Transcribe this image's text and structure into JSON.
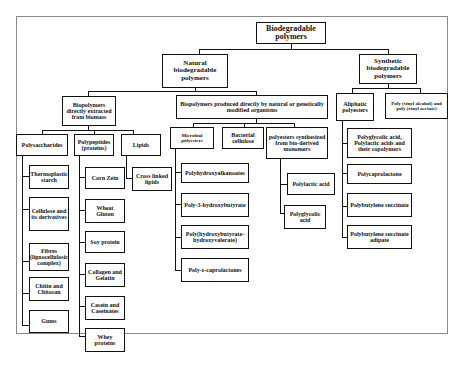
{
  "diagram": {
    "root": "Biodegradable polymers",
    "natural": {
      "label": "Natural biodegradable polymers",
      "extracted": {
        "label": "Biopolymers directly extracted from biomass",
        "polysaccharides": {
          "label": "Polysaccharides",
          "items": [
            "Thermoplastic starch",
            "Cellulose and its derivatives",
            "Fibres (lignocellulosic complex)",
            "Chitin and Chitosan",
            "Gums"
          ]
        },
        "polypeptides": {
          "label": "Polypeptides (proteins)",
          "items": [
            "Corn Zein",
            "Wheat Gluten",
            "Soy protein",
            "Collagen and Gelatin",
            "Casein and Caseinates",
            "Whey proteins"
          ]
        },
        "lipids": {
          "label": "Lipids",
          "items": [
            "Cross linked lipids"
          ]
        }
      },
      "organisms": {
        "label": "Biopolymers produced directly by natural or genetically modified organisms",
        "microbial": {
          "label": "Microbial polyesters",
          "items": [
            "Polyhydroxyalkanoates",
            "Poly-3-hydroxybutyrate",
            "Poly(hydroxybutyrate-hydroxyvalerate)",
            "Poly-ε-caprolactones"
          ]
        },
        "bacterial": {
          "label": "Bacterial cellulose"
        },
        "biomonomers": {
          "label": "polyesters synthesized from bio-derived monomers",
          "items": [
            "Polylactic acid",
            "Polyglycolic acid"
          ]
        }
      }
    },
    "synthetic": {
      "label": "Synthetic biodegradable polymers",
      "aliphatic": {
        "label": "Aliphatic polyesters",
        "items": [
          "Polyglycolic acid, Polylactic acids and their copolymers",
          "Polycaprolactone",
          "Polybutylene succinate",
          "Polybutylene succinate adipate"
        ]
      },
      "pva": {
        "label": "Poly (vinyl alcohol) and poly (vinyl acetate)"
      }
    }
  }
}
